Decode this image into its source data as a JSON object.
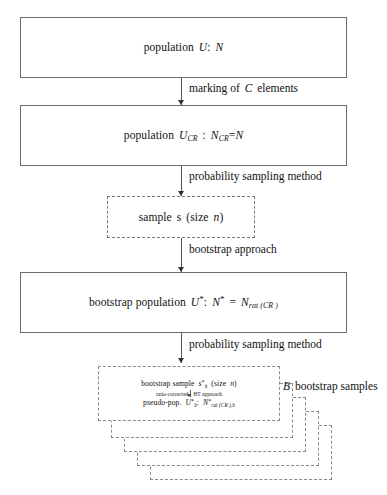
{
  "diagram": {
    "title_text": "Bootstrap resampling scheme for a capture-recapture population",
    "type": "flowchart",
    "nodes": [
      {
        "id": "population",
        "border": "solid",
        "label": "population U: N",
        "label_parts": {
          "prefix": "population",
          "symbol": "U",
          "separator": ":",
          "value": "N"
        }
      },
      {
        "id": "population-cr",
        "border": "solid",
        "label": "population U_CR : N_CR = N",
        "label_parts": {
          "prefix": "population",
          "symbol": "U",
          "symbol_sub": "CR",
          "separator": ":",
          "value": "N",
          "value_sub": "CR",
          "equals": "=",
          "value2": "N"
        }
      },
      {
        "id": "sample",
        "border": "dashed",
        "label": "sample s (size n)",
        "label_parts": {
          "prefix": "sample",
          "symbol": "s",
          "size_open": "(size",
          "size_symbol": "n",
          "size_close": ")"
        }
      },
      {
        "id": "bootstrap-population",
        "border": "solid",
        "label": "bootstrap population U*: N* = N_rat(CR)",
        "label_parts": {
          "prefix": "bootstrap population",
          "symbol": "U",
          "star": "*",
          "separator": ":",
          "value": "N",
          "value_star": "*",
          "equals": "=",
          "value2": "N",
          "value2_sub": "rat (CR )"
        }
      }
    ],
    "edges": [
      {
        "id": "edge-1",
        "label": "marking of C elements",
        "label_parts": {
          "pre": "marking of",
          "symbol": "C",
          "post": "elements"
        }
      },
      {
        "id": "edge-2",
        "label": "probability sampling method"
      },
      {
        "id": "edge-3",
        "label": "bootstrap approach"
      },
      {
        "id": "edge-4",
        "label": "probability sampling method"
      }
    ],
    "bootstrap_stack": {
      "count": 5,
      "annotation": "B bootstrap samples",
      "annotation_parts": {
        "symbol": "B",
        "text": "bootstrap samples"
      },
      "front_lines": [
        {
          "id": "front-line-1",
          "text": "bootstrap sample s*_b (size n)",
          "parts": {
            "prefix": "bootstrap sample",
            "symbol": "s",
            "star": "*",
            "sub": "b",
            "size_open": "(size",
            "size_symbol": "n",
            "size_close": ")"
          }
        },
        {
          "id": "front-line-2",
          "text": "ratio-corrected | HT approach",
          "parts": {
            "left": "ratio-corrected",
            "right": "HT approach"
          }
        },
        {
          "id": "front-line-3",
          "text": "pseudo-pop. U*_b : N*_rat(CR),b",
          "parts": {
            "prefix": "pseudo-pop.",
            "symbol": "U",
            "star": "*",
            "sub": "b",
            "separator": ":",
            "value": "N",
            "value_star": "*",
            "value_sub": "rat (CR ),b"
          }
        }
      ]
    },
    "colors": {
      "background": "#ffffff",
      "solid_border": "#6c6c6c",
      "dashed_border": "#7a7a7a",
      "stack_border": "#8a8a8a",
      "connector": "#555555",
      "text": "#111111"
    }
  }
}
